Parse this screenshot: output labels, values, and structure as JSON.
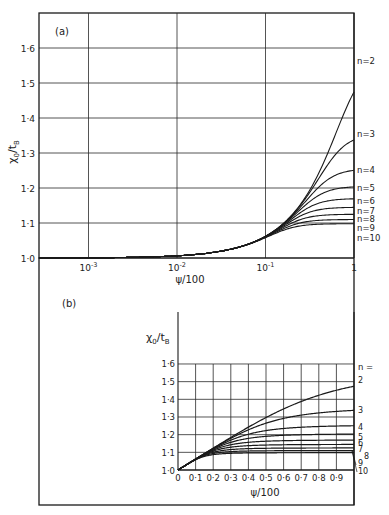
{
  "chart_data": [
    {
      "panel": "(a)",
      "type": "line",
      "title": "",
      "xlabel": "ψ/100",
      "ylabel": "χ0/tB",
      "xscale": "log",
      "xlim": [
        0.00028,
        1
      ],
      "ylim": [
        1.0,
        1.7
      ],
      "x_ticks": [
        "10⁻³",
        "10⁻²",
        "10⁻¹",
        "1"
      ],
      "y_ticks": [
        "1·0",
        "1·1",
        "1·2",
        "1·3",
        "1·4",
        "1·5",
        "1·6"
      ],
      "grid": true,
      "legend_position": "right, inline labels at curve ends",
      "series": [
        {
          "name": "n=2",
          "value_at_1": 1.563
        },
        {
          "name": "n=3",
          "value_at_1": 1.354
        },
        {
          "name": "n=4",
          "value_at_1": 1.255
        },
        {
          "name": "n=5",
          "value_at_1": 1.205
        },
        {
          "name": "n=6",
          "value_at_1": 1.17
        },
        {
          "name": "n=7",
          "value_at_1": 1.145
        },
        {
          "name": "n=8",
          "value_at_1": 1.125
        },
        {
          "name": "n=9",
          "value_at_1": 1.11
        },
        {
          "name": "n=10",
          "value_at_1": 1.098
        }
      ],
      "sample_points": {
        "x": [
          0.001,
          0.01,
          0.1,
          0.3,
          0.5,
          1.0
        ],
        "n=2": [
          1.001,
          1.006,
          1.06,
          1.18,
          1.3,
          1.563
        ],
        "n=10": [
          1.001,
          1.006,
          1.055,
          1.09,
          1.097,
          1.098
        ]
      }
    },
    {
      "panel": "(b)",
      "type": "line",
      "title": "",
      "xlabel": "ψ/100",
      "ylabel": "χ0/tB",
      "xscale": "linear",
      "xlim": [
        0,
        1.0
      ],
      "ylim": [
        1.0,
        1.6
      ],
      "x_ticks": [
        "0",
        "0·1",
        "0·2",
        "0·3",
        "0·4",
        "0·5",
        "0·6",
        "0·7",
        "0·8",
        "0·9"
      ],
      "y_ticks": [
        "1·0",
        "1·1",
        "1·2",
        "1·3",
        "1·4",
        "1·5",
        "1·6"
      ],
      "grid": true,
      "legend_title": "n =",
      "legend_position": "right, inline labels at curve ends",
      "series": [
        {
          "name": "2",
          "value_at_1": 1.563
        },
        {
          "name": "3",
          "value_at_1": 1.354
        },
        {
          "name": "4",
          "value_at_1": 1.255
        },
        {
          "name": "5",
          "value_at_1": 1.205
        },
        {
          "name": "6",
          "value_at_1": 1.17
        },
        {
          "name": "7",
          "value_at_1": 1.145
        },
        {
          "name": "8",
          "value_at_1": 1.125
        },
        {
          "name": "9",
          "value_at_1": 1.11
        },
        {
          "name": "10",
          "value_at_1": 1.098
        }
      ],
      "sample_points": {
        "x": [
          0,
          0.1,
          0.2,
          0.3,
          0.4,
          0.5,
          0.6,
          0.7,
          0.8,
          0.9,
          1.0
        ],
        "n=2": [
          1.0,
          1.06,
          1.12,
          1.18,
          1.25,
          1.32,
          1.4,
          1.48,
          1.53,
          1.56,
          1.563
        ],
        "n=3": [
          1.0,
          1.06,
          1.12,
          1.18,
          1.25,
          1.29,
          1.32,
          1.34,
          1.35,
          1.354,
          1.354
        ]
      }
    }
  ],
  "labels": {
    "panel_a": "(a)",
    "panel_b": "(b)",
    "ylabel": "χ",
    "ylabel_sub0": "0",
    "ylabel_slash": "/t",
    "ylabel_subB": "B",
    "xlabel": "ψ/100",
    "a_x_ticks": [
      {
        "base": "10",
        "exp": "-3"
      },
      {
        "base": "10",
        "exp": "-2"
      },
      {
        "base": "10",
        "exp": "-1"
      },
      {
        "base": "1",
        "exp": ""
      }
    ],
    "a_y_ticks": [
      "1·0",
      "1·1",
      "1·2",
      "1·3",
      "1·4",
      "1·5",
      "1·6"
    ],
    "a_curve_labels": [
      "n=2",
      "n=3",
      "n=4",
      "n=5",
      "n=6",
      "n=7",
      "n=8",
      "n=9",
      "n=10"
    ],
    "b_x_ticks": [
      "0",
      "0·1",
      "0·2",
      "0·3",
      "0·4",
      "0·5",
      "0·6",
      "0·7",
      "0·8",
      "0·9"
    ],
    "b_y_ticks": [
      "1·0",
      "1·1",
      "1·2",
      "1·3",
      "1·4",
      "1·5",
      "1·6"
    ],
    "b_legend_title": "n =",
    "b_curve_labels": [
      "2",
      "3",
      "4",
      "5",
      "6",
      "7",
      "8",
      "9",
      "10"
    ]
  },
  "colors": {
    "ink": "#1a1a1a",
    "grid": "#2a2a2a",
    "background": "#ffffff"
  }
}
